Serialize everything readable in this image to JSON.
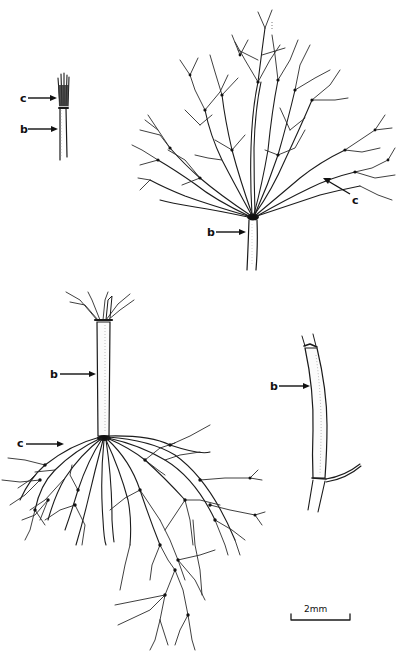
{
  "figure": {
    "type": "botanical line illustration",
    "panels": [
      {
        "id": "small-shoot",
        "labels": [
          {
            "text": "c",
            "x": 20,
            "y": 102,
            "target": "tufted whorl"
          },
          {
            "text": "b",
            "x": 20,
            "y": 133,
            "target": "stem"
          }
        ]
      },
      {
        "id": "branched-whorl-top",
        "labels": [
          {
            "text": "b",
            "x": 207,
            "y": 236,
            "target": "stem"
          },
          {
            "text": "c",
            "x": 352,
            "y": 204,
            "target": "branch whorl"
          }
        ]
      },
      {
        "id": "branched-whorl-bottom",
        "labels": [
          {
            "text": "b",
            "x": 50,
            "y": 378,
            "target": "stem internode"
          },
          {
            "text": "c",
            "x": 17,
            "y": 447,
            "target": "branch whorl"
          }
        ]
      },
      {
        "id": "stem-segment",
        "labels": [
          {
            "text": "b",
            "x": 270,
            "y": 390,
            "target": "stem"
          }
        ]
      }
    ],
    "scale_bar": {
      "label": "2mm",
      "x1": 291,
      "x2": 350,
      "y": 620
    },
    "colors": {
      "ink": "#1a1a1a",
      "background": "#ffffff"
    }
  }
}
